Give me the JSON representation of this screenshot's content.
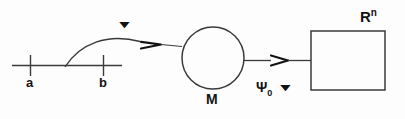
{
  "figure": {
    "type": "mathematical-diagram",
    "background_color": "#fdfdfd",
    "stroke_color": "#3a3a3a",
    "text_color": "#141414",
    "width": 405,
    "height": 119
  },
  "interval": {
    "name": "closed-interval-axis",
    "left_endpoint_label": "a",
    "right_endpoint_label": "b",
    "line_start_x": 12,
    "line_end_x": 122,
    "line_y": 65,
    "tick_a_x": 30,
    "tick_b_x": 103
  },
  "curve_arrow": {
    "name": "gamma-curve-arrow",
    "label": "▼",
    "label_x": 124,
    "label_y": 22,
    "from": "interval",
    "to": "manifold"
  },
  "manifold": {
    "name": "manifold-circle",
    "label": "M",
    "center_x": 213,
    "center_y": 58,
    "radius": 31
  },
  "map_arrow": {
    "name": "psi-map-arrow",
    "label": "Ψ",
    "subscript": "0",
    "marker": "▼",
    "from": "manifold",
    "to": "euclidean-space"
  },
  "euclidean_space": {
    "name": "euclidean-space-rectangle",
    "label": "R",
    "superscript": "n",
    "x": 311,
    "y": 31,
    "width": 74,
    "height": 59
  }
}
